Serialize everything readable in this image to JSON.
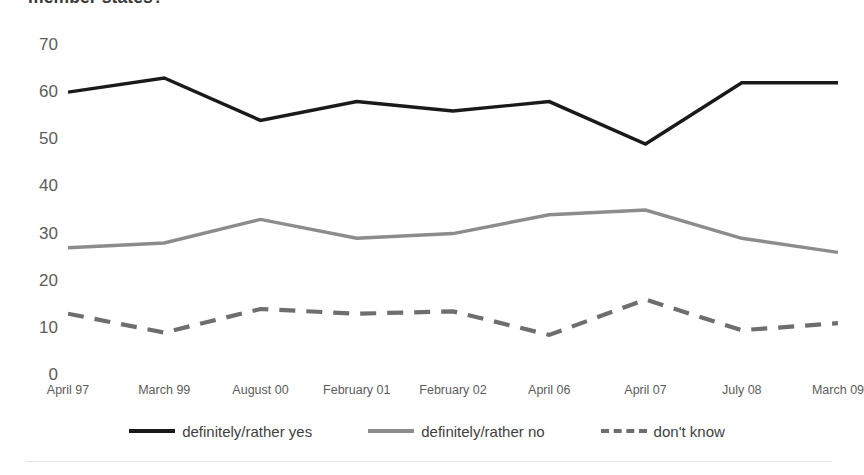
{
  "chart_data": {
    "type": "line",
    "title": "member states?",
    "xlabel": "",
    "ylabel": "",
    "ylim": [
      0,
      70
    ],
    "yticks": [
      70,
      60,
      50,
      40,
      30,
      20,
      10,
      0
    ],
    "grid": false,
    "legend_position": "bottom",
    "categories": [
      "April 97",
      "March 99",
      "August 00",
      "February 01",
      "February 02",
      "April 06",
      "April 07",
      "July 08",
      "March 09"
    ],
    "series": [
      {
        "name": "definitely/rather yes",
        "color": "#1a1a1a",
        "style": "solid",
        "width": 3.4,
        "values": [
          60,
          63,
          54,
          58,
          56,
          58,
          49,
          62,
          62
        ]
      },
      {
        "name": "definitely/rather no",
        "color": "#8c8c8c",
        "style": "solid",
        "width": 3.4,
        "values": [
          27,
          28,
          33,
          29,
          30,
          34,
          35,
          29,
          26
        ]
      },
      {
        "name": "don't know",
        "color": "#6e6e6e",
        "style": "dashed",
        "width": 4.2,
        "values": [
          13,
          9,
          14,
          13,
          13.5,
          8.5,
          16,
          9.5,
          11
        ]
      }
    ]
  },
  "colors": {
    "background": "#ffffff",
    "axis_text": "#5c5c5c",
    "title_text": "#3a3a3a",
    "legend_text": "#3f3f3f",
    "rule": "#e4e4e4"
  }
}
